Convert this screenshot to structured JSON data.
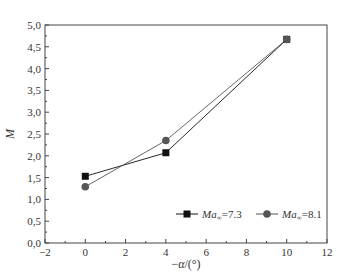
{
  "chart_data": {
    "type": "line",
    "title": "",
    "xlabel": "−α/(°)",
    "ylabel": "M",
    "xlim": [
      -2,
      12
    ],
    "ylim": [
      0,
      5
    ],
    "xticks": [
      -2,
      0,
      2,
      4,
      6,
      8,
      10,
      12
    ],
    "xtick_labels": [
      "−2",
      "0",
      "2",
      "4",
      "6",
      "8",
      "10",
      "12"
    ],
    "yticks": [
      0,
      0.5,
      1,
      1.5,
      2,
      2.5,
      3,
      3.5,
      4,
      4.5,
      5
    ],
    "ytick_labels": [
      "0,0",
      "0,5",
      "1,0",
      "1,5",
      "2,0",
      "2,5",
      "3,0",
      "3,5",
      "4,0",
      "4,5",
      "5,0"
    ],
    "grid": false,
    "legend_position": "lower right",
    "series": [
      {
        "name": "Ma∞=7.3",
        "legend_prefix": "Ma",
        "legend_sub": "∞",
        "legend_value": "=7.3",
        "marker": "square",
        "color": "#111111",
        "x": [
          0,
          4,
          10
        ],
        "y": [
          1.53,
          2.07,
          4.67
        ]
      },
      {
        "name": "Ma∞=8.1",
        "legend_prefix": "Ma",
        "legend_sub": "∞",
        "legend_value": "=8.1",
        "marker": "circle",
        "color": "#555555",
        "x": [
          0,
          4,
          10
        ],
        "y": [
          1.29,
          2.35,
          4.67
        ]
      }
    ]
  }
}
